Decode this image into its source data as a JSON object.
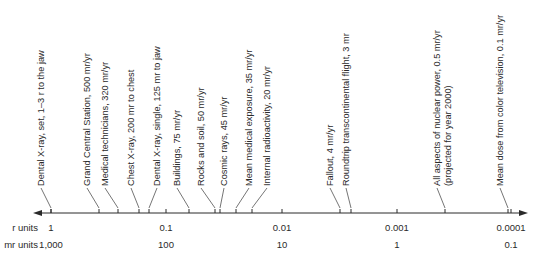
{
  "chart_data": {
    "type": "scale-diagram",
    "title": "",
    "axis": {
      "scale": "log",
      "direction": "decreasing left-to-right",
      "row_labels": {
        "r": "r units",
        "mr": "mr units"
      },
      "ticks": [
        {
          "r": "1",
          "mr": "1,000",
          "x": 51
        },
        {
          "r": "0.1",
          "mr": "100",
          "x": 166
        },
        {
          "r": "0.01",
          "mr": "10",
          "x": 282
        },
        {
          "r": "0.001",
          "mr": "1",
          "x": 397
        },
        {
          "r": "0.0001",
          "mr": "0.1",
          "x": 511
        }
      ]
    },
    "items": [
      {
        "label": "Dental X-ray, set, 1–3 r to the jaw",
        "value_mr": 1000,
        "tick_x": 51,
        "text_x": 44
      },
      {
        "label": "Grand Central Station, 500 mr/yr",
        "value_mr": 500,
        "tick_x": 99,
        "text_x": 90
      },
      {
        "label": "Medical technicians, 320 mr/yr",
        "value_mr": 320,
        "tick_x": 118,
        "text_x": 108
      },
      {
        "label": "Chest X-ray, 200 mr to chest",
        "value_mr": 200,
        "tick_x": 139,
        "text_x": 134
      },
      {
        "label": "Dental X-ray, single, 125 mr to jaw",
        "value_mr": 125,
        "tick_x": 149,
        "text_x": 160
      },
      {
        "label": "Buildings, 75 mr/yr",
        "value_mr": 75,
        "tick_x": 189,
        "text_x": 180
      },
      {
        "label": "Rocks and soil, 50 mr/yr",
        "value_mr": 50,
        "tick_x": 215,
        "text_x": 204
      },
      {
        "label": "Cosmic rays, 45 mr/yr",
        "value_mr": 45,
        "tick_x": 220,
        "text_x": 227
      },
      {
        "label": "Mean medical exposure, 35 mr/yr",
        "value_mr": 35,
        "tick_x": 236,
        "text_x": 252
      },
      {
        "label": "Internal radioactivity, 20 mr/yr",
        "value_mr": 20,
        "tick_x": 252,
        "text_x": 270
      },
      {
        "label": "Fallout, 4 mr/yr",
        "value_mr": 4,
        "tick_x": 340,
        "text_x": 333
      },
      {
        "label": "Roundtrip transcontinental flight, 3 mr",
        "value_mr": 3,
        "tick_x": 351,
        "text_x": 349
      },
      {
        "label": "All aspects of nuclear power, 0.5 mr/yr",
        "label2": "(projected for year 2000)",
        "value_mr": 0.5,
        "tick_x": 445,
        "text_x": 440
      },
      {
        "label": "Mean dose from color television, 0.1 mr/yr",
        "value_mr": 0.1,
        "tick_x": 508,
        "text_x": 503
      }
    ]
  }
}
